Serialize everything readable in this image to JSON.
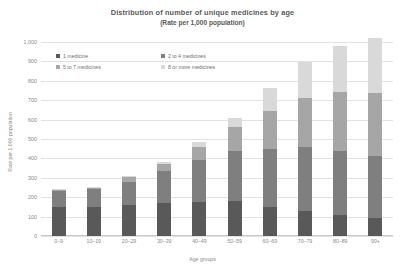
{
  "chart_data": {
    "type": "bar",
    "stacked": true,
    "title": "Distribution of number of unique medicines by age",
    "subtitle": "(Rate per 1,000 population)",
    "xlabel": "Age groups",
    "ylabel": "Rate per 1,000 population",
    "ylim": [
      0,
      1000
    ],
    "yticks": [
      "1,000",
      "900",
      "800",
      "700",
      "600",
      "500",
      "400",
      "300",
      "200",
      "100",
      "0"
    ],
    "ytick_values": [
      1000,
      900,
      800,
      700,
      600,
      500,
      400,
      300,
      200,
      100,
      0
    ],
    "grid": true,
    "legend_position": "top-left",
    "categories": [
      "0–9",
      "10–19",
      "20–29",
      "30–39",
      "40–49",
      "50–59",
      "60–69",
      "70–79",
      "80–89",
      "90+"
    ],
    "series": [
      {
        "name": "1 medicine",
        "color": "#595959",
        "values": [
          152,
          152,
          160,
          170,
          175,
          180,
          150,
          130,
          110,
          95
        ]
      },
      {
        "name": "2 to 4 medicines",
        "color": "#7f7f7f",
        "values": [
          80,
          88,
          120,
          165,
          215,
          260,
          300,
          330,
          330,
          320
        ]
      },
      {
        "name": "5 to 7 medicines",
        "color": "#a6a6a6",
        "values": [
          5,
          8,
          22,
          35,
          70,
          120,
          195,
          250,
          300,
          320
        ]
      },
      {
        "name": "8 or more medicines",
        "color": "#d9d9d9",
        "values": [
          3,
          4,
          8,
          12,
          25,
          50,
          120,
          185,
          240,
          285
        ]
      }
    ],
    "totals": [
      240,
      252,
      310,
      382,
      485,
      610,
      765,
      895,
      980,
      1020
    ]
  }
}
